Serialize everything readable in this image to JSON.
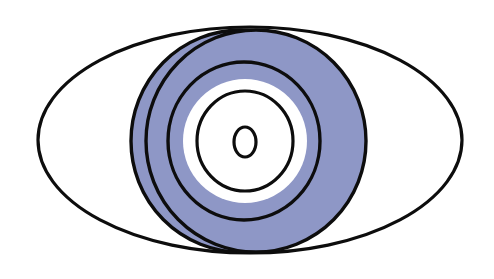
{
  "diagram": {
    "title": "",
    "colors": {
      "background": "#ffffff",
      "stroke": "#0d0d0d",
      "iris_fill": "#8e97c6",
      "inner_fill": "#ffffff"
    },
    "shapes": [
      {
        "id": "eye-outline",
        "cx": 250,
        "cy": 140,
        "rx": 212,
        "ry": 113,
        "fill": "none",
        "stroke_width": 3.2
      },
      {
        "id": "iris-ellipse-a",
        "cx": 241,
        "cy": 141,
        "rx": 110,
        "ry": 111,
        "fill": "iris",
        "stroke_width": 3.4
      },
      {
        "id": "iris-ellipse-b",
        "cx": 256,
        "cy": 141,
        "rx": 110,
        "ry": 111,
        "fill": "iris",
        "stroke_width": 3.4
      },
      {
        "id": "ring-3",
        "cx": 244,
        "cy": 141,
        "rx": 76,
        "ry": 79,
        "fill": "none",
        "stroke_width": 3.4
      },
      {
        "id": "white-disc",
        "cx": 245,
        "cy": 141,
        "rx": 62,
        "ry": 62,
        "fill": "inner",
        "stroke_width": 0
      },
      {
        "id": "ring-4",
        "cx": 245,
        "cy": 141,
        "rx": 48,
        "ry": 50,
        "fill": "none",
        "stroke_width": 3.2
      },
      {
        "id": "pupil",
        "cx": 245,
        "cy": 142,
        "rx": 11,
        "ry": 15,
        "fill": "inner",
        "stroke_width": 3.2
      }
    ]
  }
}
